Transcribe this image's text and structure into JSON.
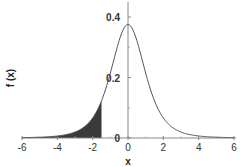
{
  "chart_data": {
    "type": "area",
    "title": "",
    "xlabel": "x",
    "ylabel": "f (x)",
    "xlim": [
      -6,
      6
    ],
    "ylim": [
      0,
      0.4
    ],
    "grid": false,
    "legend": null,
    "x_ticks": [
      -6,
      -4,
      -2,
      0,
      2,
      4,
      6
    ],
    "x_tick_labels": [
      "-6",
      "-4",
      "-2",
      "0",
      "2",
      "4",
      "6"
    ],
    "y_ticks": [
      0,
      0.2,
      0.4
    ],
    "y_tick_labels": [
      "0",
      "0.2",
      "0.4"
    ],
    "y_minor_ticks": [
      0.1,
      0.3
    ],
    "x_minor_ticks": [
      -5,
      -3,
      -1,
      1,
      3,
      5
    ],
    "series": [
      {
        "name": "density curve",
        "description": "Bell-shaped density (Student-t like, ~4 df)",
        "color": "#555555",
        "x": [
          -6,
          -5.5,
          -5,
          -4.5,
          -4,
          -3.5,
          -3,
          -2.5,
          -2,
          -1.5,
          -1,
          -0.5,
          0,
          0.5,
          1,
          1.5,
          2,
          2.5,
          3,
          3.5,
          4,
          4.5,
          5,
          5.5,
          6
        ],
        "values": [
          0.0042,
          0.0058,
          0.008,
          0.0114,
          0.0166,
          0.0249,
          0.0387,
          0.0624,
          0.1067,
          0.1225,
          0.22,
          0.3221,
          0.375,
          0.3221,
          0.22,
          0.1225,
          0.0663,
          0.0624,
          0.0387,
          0.0249,
          0.0166,
          0.0114,
          0.008,
          0.0058,
          0.0042
        ]
      }
    ],
    "shaded_region": {
      "from": -6,
      "to": -1.5,
      "color": "#3a3a3a",
      "description": "Left-tail area under the curve"
    },
    "annotations": []
  }
}
